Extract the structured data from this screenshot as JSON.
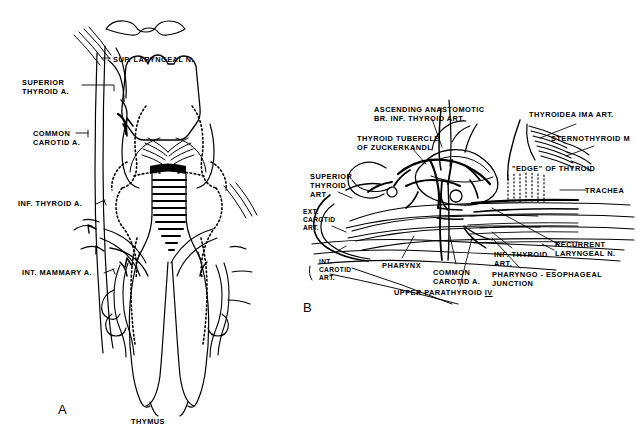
{
  "figure": {
    "background": "#ffffff",
    "ink": "#000000",
    "width": 637,
    "height": 434
  },
  "panels": [
    {
      "id": "A",
      "letter": "A",
      "x": 58,
      "y": 402
    },
    {
      "id": "B",
      "letter": "B",
      "x": 303,
      "y": 300
    }
  ],
  "panel_a": {
    "labels": [
      {
        "name": "sup-laryngeal-n",
        "text": "SUP. LARYNGEAL N.",
        "x": 113,
        "y": 55,
        "align": "left"
      },
      {
        "name": "superior-thyroid-a",
        "text": "SUPERIOR\nTHYROID A.",
        "x": 22,
        "y": 78,
        "align": "left"
      },
      {
        "name": "common-carotid-a",
        "text": "COMMON\nCAROTID A.",
        "x": 33,
        "y": 129,
        "align": "left"
      },
      {
        "name": "inf-thyroid-a",
        "text": "INF. THYROID A.",
        "x": 18,
        "y": 199,
        "align": "left"
      },
      {
        "name": "int-mammary-a",
        "text": "INT. MAMMARY A.",
        "x": 22,
        "y": 268,
        "align": "left"
      },
      {
        "name": "thymus",
        "text": "THYMUS",
        "x": 131,
        "y": 417,
        "align": "left"
      }
    ]
  },
  "panel_b": {
    "labels": [
      {
        "name": "ascending-anastomotic-br-inf-thyroid-art",
        "text": "ASCENDING ANASTOMOTIC\nBR. INF. THYROID ART.",
        "x": 374,
        "y": 105,
        "align": "left"
      },
      {
        "name": "thyroidea-ima-art",
        "text": "THYROIDEA IMA ART.",
        "x": 529,
        "y": 110,
        "align": "left"
      },
      {
        "name": "thyroid-tubercle-of-zuckerkandl",
        "text": "THYROID TUBERCLE\nOF ZUCKERKANDL",
        "x": 357,
        "y": 134,
        "align": "left"
      },
      {
        "name": "sternothyroid-m",
        "text": "STERNOTHYROID M",
        "x": 551,
        "y": 134,
        "align": "left"
      },
      {
        "name": "edge-of-thyroid",
        "text": "\"EDGE\" OF THYROID",
        "x": 512,
        "y": 164,
        "align": "left"
      },
      {
        "name": "superior-thyroid-art",
        "text": "SUPERIOR\nTHYROID\nART",
        "x": 310,
        "y": 172,
        "align": "left"
      },
      {
        "name": "trachea",
        "text": "TRACHEA",
        "x": 585,
        "y": 186,
        "align": "left"
      },
      {
        "name": "ext-carotid-art",
        "text": "EXT.\nCAROTID\nART.",
        "x": 303,
        "y": 208,
        "align": "left"
      },
      {
        "name": "recurrent-laryngeal-n",
        "text": "RECURRENT\nLARYNGEAL N.",
        "x": 555,
        "y": 240,
        "align": "left"
      },
      {
        "name": "int-carotid-art",
        "text": "INT.\nCAROTID\nART.",
        "x": 319,
        "y": 258,
        "align": "left"
      },
      {
        "name": "pharynx",
        "text": "PHARYNX",
        "x": 382,
        "y": 261,
        "align": "left"
      },
      {
        "name": "inf-thyroid-art",
        "text": "INF. THYROID\nART.",
        "x": 494,
        "y": 250,
        "align": "left"
      },
      {
        "name": "common-carotid-a",
        "text": "COMMON\nCAROTID A.",
        "x": 433,
        "y": 268,
        "align": "left"
      },
      {
        "name": "pharyngo-esophageal-junction",
        "text": "PHARYNGO - ESOPHAGEAL\nJUNCTION",
        "x": 492,
        "y": 270,
        "align": "left"
      },
      {
        "name": "upper-parathyroid",
        "text": "UPPER PARATHYROID ",
        "numeral": "IV",
        "x": 394,
        "y": 288,
        "align": "left"
      }
    ]
  }
}
